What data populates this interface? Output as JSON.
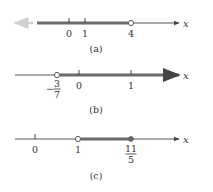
{
  "figures": [
    {
      "caption": "(a)",
      "axis_label": "x",
      "ticks": [
        {
          "value": 0,
          "label": "0"
        },
        {
          "value": 1,
          "label": "1"
        }
      ],
      "endpoint": {
        "label": "4",
        "type": "open"
      },
      "shaded": "x < 4",
      "left_arrow": "faded"
    },
    {
      "caption": "(b)",
      "axis_label": "x",
      "ticks": [
        {
          "value": 0,
          "label": "0"
        },
        {
          "value": 1,
          "label": "1"
        }
      ],
      "endpoint": {
        "label_num": "3",
        "label_den": "7",
        "sign": "−",
        "type": "open"
      },
      "shaded": "x > -3/7"
    },
    {
      "caption": "(c)",
      "axis_label": "x",
      "ticks": [
        {
          "value": 0,
          "label": "0"
        }
      ],
      "left_endpoint": {
        "label": "1",
        "type": "open"
      },
      "right_endpoint": {
        "label_num": "11",
        "label_den": "5",
        "type": "closed"
      },
      "shaded": "1 < x ≤ 11/5"
    }
  ],
  "colors": {
    "axis": "#555555",
    "shade": "#6b6b6b",
    "faded": "#c8c8c8",
    "text": "#333333"
  }
}
